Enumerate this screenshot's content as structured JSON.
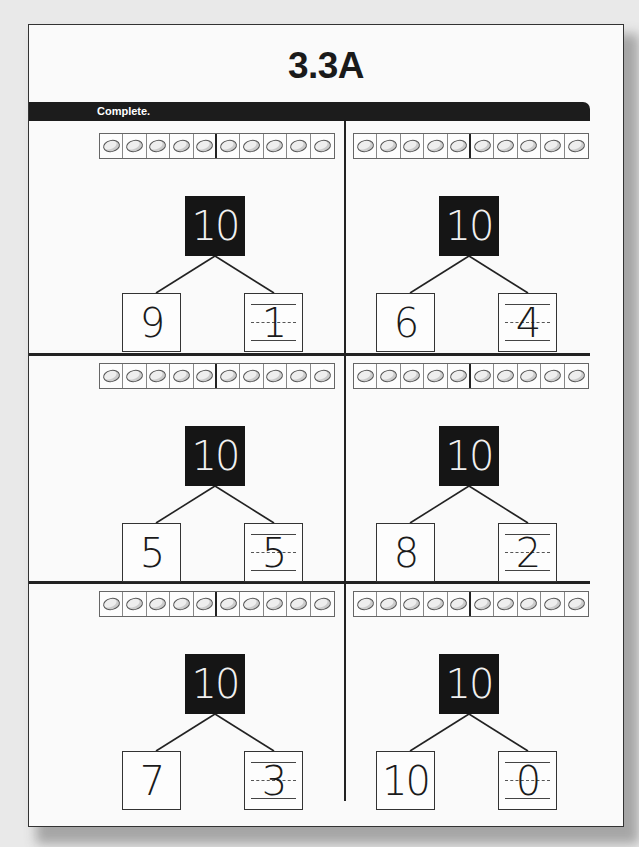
{
  "page": {
    "title": "3.3A",
    "instruction": "Complete."
  },
  "problems": [
    {
      "whole": "10",
      "part_given": "9",
      "part_answer": "1",
      "counters": 10
    },
    {
      "whole": "10",
      "part_given": "6",
      "part_answer": "4",
      "counters": 10
    },
    {
      "whole": "10",
      "part_given": "5",
      "part_answer": "5",
      "counters": 10
    },
    {
      "whole": "10",
      "part_given": "8",
      "part_answer": "2",
      "counters": 10
    },
    {
      "whole": "10",
      "part_given": "7",
      "part_answer": "3",
      "counters": 10
    },
    {
      "whole": "10",
      "part_given": "10",
      "part_answer": "0",
      "counters": 10
    }
  ],
  "colors": {
    "band": "#1c1c1c",
    "whole_box": "#151515",
    "page": "#fafafa",
    "border": "#333333"
  }
}
